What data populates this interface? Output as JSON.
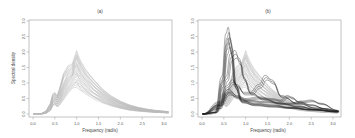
{
  "chart_data": [
    {
      "panel": "a",
      "type": "line",
      "title": "(a)",
      "xlabel": "Frequency (rad/s)",
      "ylabel": "Spectral density",
      "xlim": [
        0.0,
        3.2
      ],
      "ylim": [
        0.0,
        3.0
      ],
      "xticks": [
        "0.0",
        "0.5",
        "1.0",
        "1.5",
        "2.0",
        "2.5",
        "3.0"
      ],
      "yticks": [
        "0.0",
        "0.5",
        "1.0",
        "1.5",
        "2.0",
        "2.5",
        "3.0"
      ],
      "grid": false,
      "description": "Ensemble of many gray spectral density curves forming a band",
      "series": [
        {
          "name": "envelope-upper",
          "color": "#b0b0b0",
          "x": [
            0.0,
            0.2,
            0.3,
            0.4,
            0.45,
            0.5,
            0.55,
            0.6,
            0.7,
            0.8,
            0.9,
            0.95,
            1.0,
            1.05,
            1.1,
            1.2,
            1.4,
            1.6,
            1.8,
            2.0,
            2.2,
            2.4,
            2.6,
            2.8,
            3.0,
            3.1
          ],
          "y": [
            0.0,
            0.02,
            0.1,
            0.35,
            0.65,
            0.7,
            0.6,
            0.8,
            1.3,
            1.55,
            1.65,
            1.85,
            2.05,
            1.85,
            1.7,
            1.45,
            1.1,
            0.8,
            0.58,
            0.42,
            0.3,
            0.22,
            0.16,
            0.12,
            0.09,
            0.08
          ]
        },
        {
          "name": "envelope-lower",
          "color": "#b0b0b0",
          "x": [
            0.0,
            0.2,
            0.3,
            0.4,
            0.45,
            0.5,
            0.55,
            0.6,
            0.7,
            0.8,
            0.9,
            0.95,
            1.0,
            1.05,
            1.1,
            1.2,
            1.4,
            1.6,
            1.8,
            2.0,
            2.2,
            2.4,
            2.6,
            2.8,
            3.0,
            3.1
          ],
          "y": [
            0.0,
            0.0,
            0.02,
            0.1,
            0.25,
            0.3,
            0.22,
            0.25,
            0.45,
            0.65,
            0.8,
            0.85,
            0.85,
            0.8,
            0.75,
            0.65,
            0.48,
            0.35,
            0.25,
            0.18,
            0.12,
            0.09,
            0.07,
            0.05,
            0.04,
            0.03
          ]
        }
      ]
    },
    {
      "panel": "b",
      "type": "line",
      "title": "(b)",
      "xlabel": "Frequency (rad/s)",
      "ylabel": "",
      "xlim": [
        0.0,
        3.2
      ],
      "ylim": [
        0.0,
        3.0
      ],
      "xticks": [
        "0.0",
        "0.5",
        "1.0",
        "1.5",
        "2.0",
        "2.5",
        "3.0"
      ],
      "yticks": [
        "0.0",
        "0.5",
        "1.0",
        "1.5",
        "2.0",
        "2.5",
        "3.0"
      ],
      "grid": false,
      "description": "Same gray ensemble band with overlaid black individual spectra",
      "series": [
        {
          "name": "black-1",
          "color": "#222222",
          "x": [
            0.0,
            0.3,
            0.45,
            0.55,
            0.6,
            0.65,
            0.75,
            0.9,
            1.2,
            1.6,
            2.0,
            2.5,
            3.1
          ],
          "y": [
            0.0,
            0.05,
            1.2,
            2.6,
            2.8,
            2.4,
            1.0,
            0.45,
            0.35,
            0.3,
            0.22,
            0.15,
            0.08
          ]
        },
        {
          "name": "black-2",
          "color": "#222222",
          "x": [
            0.0,
            0.3,
            0.45,
            0.55,
            0.6,
            0.65,
            0.75,
            0.9,
            1.2,
            1.6,
            2.0,
            2.5,
            3.1
          ],
          "y": [
            0.0,
            0.05,
            1.0,
            2.2,
            2.45,
            2.1,
            0.9,
            0.4,
            0.3,
            0.25,
            0.2,
            0.14,
            0.07
          ]
        },
        {
          "name": "black-3",
          "color": "#222222",
          "x": [
            0.0,
            0.4,
            0.55,
            0.65,
            0.75,
            0.85,
            0.95,
            1.1,
            1.4,
            1.8,
            2.2,
            2.6,
            3.1
          ],
          "y": [
            0.0,
            0.2,
            1.2,
            1.95,
            2.05,
            1.8,
            1.2,
            0.7,
            0.5,
            0.35,
            0.25,
            0.15,
            0.08
          ]
        },
        {
          "name": "black-4",
          "color": "#222222",
          "x": [
            0.0,
            0.4,
            0.55,
            0.7,
            0.8,
            0.95,
            1.1,
            1.3,
            1.45,
            1.6,
            1.8,
            2.2,
            2.6,
            3.1
          ],
          "y": [
            0.0,
            0.3,
            0.9,
            1.1,
            0.95,
            0.7,
            0.7,
            0.95,
            1.25,
            1.1,
            0.6,
            0.35,
            0.2,
            0.1
          ]
        },
        {
          "name": "black-5",
          "color": "#222222",
          "x": [
            0.0,
            0.4,
            0.6,
            0.8,
            1.0,
            1.3,
            1.6,
            1.8,
            1.95,
            2.05,
            2.2,
            2.5,
            2.8,
            3.1
          ],
          "y": [
            0.0,
            0.4,
            0.8,
            0.6,
            0.5,
            0.55,
            0.5,
            0.45,
            0.6,
            0.55,
            0.4,
            0.3,
            0.18,
            0.1
          ]
        },
        {
          "name": "black-6",
          "color": "#222222",
          "x": [
            0.0,
            0.4,
            0.6,
            0.8,
            1.0,
            1.5,
            2.0,
            2.3,
            2.5,
            2.7,
            3.1
          ],
          "y": [
            0.0,
            0.3,
            0.7,
            0.55,
            0.45,
            0.4,
            0.35,
            0.42,
            0.45,
            0.35,
            0.12
          ]
        }
      ]
    }
  ],
  "panels": {
    "a": {
      "title": "(a)",
      "xlabel": "Frequency (rad/s)",
      "ylabel": "Spectral density"
    },
    "b": {
      "title": "(b)",
      "xlabel": "Frequency (rad/s)"
    }
  }
}
